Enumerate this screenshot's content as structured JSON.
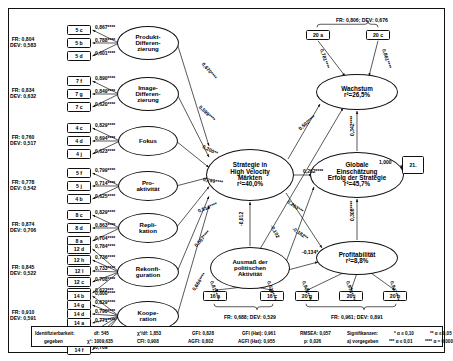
{
  "constructs": [
    {
      "id": "produkt",
      "label": "Produkt-\nDifferen-\nzierung",
      "x": 148,
      "y": 43,
      "rx": 31,
      "ry": 17
    },
    {
      "id": "image",
      "label": "Image-\nDifferen-\nzierung",
      "x": 148,
      "y": 94,
      "rx": 31,
      "ry": 17
    },
    {
      "id": "fokus",
      "label": "Fokus",
      "x": 148,
      "y": 141,
      "rx": 30,
      "ry": 15
    },
    {
      "id": "proaktivitaet",
      "label": "Pro-\naktivität",
      "x": 148,
      "y": 186,
      "rx": 30,
      "ry": 15
    },
    {
      "id": "replikation",
      "label": "Repli-\nkation",
      "x": 148,
      "y": 228,
      "rx": 30,
      "ry": 15
    },
    {
      "id": "rekonfiguration",
      "label": "Rekonfi-\nguration",
      "x": 148,
      "y": 272,
      "rx": 31,
      "ry": 15
    },
    {
      "id": "kooperation",
      "label": "Koope-\nration",
      "x": 148,
      "y": 316,
      "rx": 31,
      "ry": 15
    },
    {
      "id": "strategie",
      "label": "Strategie in\nHigh Velocity\nMärkten\nr²=40,0%",
      "x": 250,
      "y": 175,
      "rx": 44,
      "ry": 26
    },
    {
      "id": "politisch",
      "label": "Ausmaß der\npolitischen\nAktivität",
      "x": 250,
      "y": 268,
      "rx": 40,
      "ry": 21
    },
    {
      "id": "wachstum",
      "label": "Wachstum\nr²=26,5%",
      "x": 357,
      "y": 92,
      "rx": 41,
      "ry": 18
    },
    {
      "id": "global",
      "label": "Globale\nEinschätzung\nErfolg der Strategie\nr²=45,7%",
      "x": 357,
      "y": 175,
      "rx": 47,
      "ry": 23
    },
    {
      "id": "profitabilitaet",
      "label": "Profitabilität\nr²=8,8%",
      "x": 357,
      "y": 258,
      "rx": 41,
      "ry": 17
    }
  ],
  "indicator_groups": [
    {
      "id": "g-produkt",
      "fr": "FR: 0,804",
      "dev": "DEV: 0,583",
      "fr_x": 10,
      "fr_y": 40,
      "boxes": [
        {
          "label": "5 c",
          "x": 79,
          "y": 30
        },
        {
          "label": "5 b",
          "x": 79,
          "y": 43
        },
        {
          "label": "5 d",
          "x": 79,
          "y": 56
        }
      ],
      "loadings": [
        "0,867****",
        "0,788****",
        "0,601****"
      ]
    },
    {
      "id": "g-image",
      "fr": "FR: 0,834",
      "dev": "DEV: 0,632",
      "fr_x": 10,
      "fr_y": 91,
      "boxes": [
        {
          "label": "7 f",
          "x": 79,
          "y": 81
        },
        {
          "label": "7 g",
          "x": 79,
          "y": 94
        },
        {
          "label": "7 c",
          "x": 79,
          "y": 107
        }
      ],
      "loadings": [
        "0,890****",
        "0,849****",
        "0,620****"
      ]
    },
    {
      "id": "g-fokus",
      "fr": "FR: 0,760",
      "dev": "DEV: 0,517",
      "fr_x": 10,
      "fr_y": 138,
      "boxes": [
        {
          "label": "4 c",
          "x": 79,
          "y": 128
        },
        {
          "label": "4 d",
          "x": 79,
          "y": 141
        },
        {
          "label": "4 j",
          "x": 79,
          "y": 154
        }
      ],
      "loadings": [
        "0,829****",
        "0,694****",
        "0,623****"
      ]
    },
    {
      "id": "g-proaktiv",
      "fr": "FR: 0,778",
      "dev": "DEV: 0,542",
      "fr_x": 10,
      "fr_y": 183,
      "boxes": [
        {
          "label": "5 f",
          "x": 79,
          "y": 173
        },
        {
          "label": "5 j",
          "x": 79,
          "y": 186
        },
        {
          "label": "4 b",
          "x": 79,
          "y": 199
        }
      ],
      "loadings": [
        "0,799****",
        "0,714****",
        "0,625****"
      ]
    },
    {
      "id": "g-replikation",
      "fr": "FR: 0,874",
      "dev": "DEV: 0,706",
      "fr_x": 10,
      "fr_y": 225,
      "boxes": [
        {
          "label": "8 c",
          "x": 79,
          "y": 215
        },
        {
          "label": "8 d",
          "x": 79,
          "y": 228
        },
        {
          "label": "8 a",
          "x": 79,
          "y": 241
        }
      ],
      "loadings": [
        "0,829****",
        "0,863****",
        "0,704****"
      ]
    },
    {
      "id": "g-rekonfig",
      "fr": "FR: 0,845",
      "dev": "DEV: 0,522",
      "fr_x": 10,
      "fr_y": 268,
      "boxes": [
        {
          "label": "12 d",
          "x": 79,
          "y": 249
        },
        {
          "label": "12 h",
          "x": 79,
          "y": 260
        },
        {
          "label": "12 l",
          "x": 79,
          "y": 271
        },
        {
          "label": "12 c",
          "x": 79,
          "y": 282
        },
        {
          "label": "12 e",
          "x": 79,
          "y": 293
        }
      ],
      "loadings": [
        "0,784****",
        "0,736****",
        "0,733****",
        "0,708****",
        "0,622***"
      ]
    },
    {
      "id": "g-kooperation",
      "fr": "FR: 0,910",
      "dev": "DEV: 0,591",
      "fr_x": 10,
      "fr_y": 313,
      "boxes": [
        {
          "label": "14 b",
          "x": 79,
          "y": 296
        },
        {
          "label": "14 g",
          "x": 79,
          "y": 305
        },
        {
          "label": "14 d",
          "x": 79,
          "y": 314
        },
        {
          "label": "14 a",
          "x": 79,
          "y": 323
        },
        {
          "label": "14 e",
          "x": 79,
          "y": 332
        },
        {
          "label": "14 c",
          "x": 79,
          "y": 341
        },
        {
          "label": "14 f",
          "x": 79,
          "y": 350
        }
      ],
      "loadings": [
        "0,800****",
        "0,829****",
        "0,790****",
        "0,771****",
        "0,757****",
        "0,704****",
        "0,709****"
      ]
    }
  ],
  "top_group": {
    "id": "g-wachstum",
    "frdev": "FR: 0,806; DEV: 0,676",
    "x": 368,
    "y": 17,
    "boxes": [
      {
        "label": "20 a",
        "x": 318,
        "y": 35
      },
      {
        "label": "20 c",
        "x": 378,
        "y": 35
      }
    ],
    "loadings": [
      "0,781****",
      "0,861****"
    ]
  },
  "bottom_mid_group": {
    "id": "g-politisch",
    "frdev": "FR: 0,688; DEV: 0,529",
    "x": 257,
    "y": 316,
    "boxes": [
      {
        "label": "16 a",
        "x": 215,
        "y": 296
      },
      {
        "label": "16 c",
        "x": 272,
        "y": 296
      }
    ],
    "loadings": [
      "0,811****",
      "0,639****"
    ]
  },
  "bottom_right_group": {
    "id": "g-profitabilitaet",
    "frdev": "FR: 0,961; DEV: 0,891",
    "x": 364,
    "y": 316,
    "boxes": [
      {
        "label": "20 g",
        "x": 307,
        "y": 296
      },
      {
        "label": "20 i",
        "x": 351,
        "y": 296
      },
      {
        "label": "20 h",
        "x": 395,
        "y": 296
      }
    ],
    "loadings": [
      "0,908****",
      "0,978****",
      "0,947****"
    ]
  },
  "terminal_box": {
    "label": "21.",
    "x": 413,
    "y": 165,
    "path_label": "1,000"
  },
  "structural_paths": [
    {
      "id": "produkt-strategie",
      "label": "0,670****",
      "x": 203,
      "y": 60,
      "rot": 50
    },
    {
      "id": "image-strategie",
      "label": "0,599****",
      "x": 200,
      "y": 103,
      "rot": 44
    },
    {
      "id": "fokus-strategie",
      "label": "0,200**",
      "x": 203,
      "y": 143,
      "rot": 27
    },
    {
      "id": "proaktiv-strategie",
      "label": "0,799****",
      "x": 203,
      "y": 176,
      "rot": 9
    },
    {
      "id": "replikation-strategie",
      "label": "0,514****",
      "x": 198,
      "y": 208,
      "rot": -22
    },
    {
      "id": "rekonfig-strategie",
      "label": "0,587****",
      "x": 195,
      "y": 243,
      "rot": -48
    },
    {
      "id": "kooperation-strategie",
      "label": "0,664****",
      "x": 193,
      "y": 287,
      "rot": -56
    },
    {
      "id": "strategie-wachstum",
      "label": "0,502****",
      "x": 299,
      "y": 126,
      "rot": -40
    },
    {
      "id": "strategie-global",
      "label": "0,262****",
      "x": 303,
      "y": 168,
      "rot": 0
    },
    {
      "id": "strategie-profitabilitaet",
      "label": "0,263***",
      "x": 288,
      "y": 198,
      "rot": 35
    },
    {
      "id": "politisch-wachstum",
      "label": "-0,102",
      "x": 272,
      "y": 222,
      "rot": 63
    },
    {
      "id": "politisch-global",
      "label": "-0,182**",
      "x": 293,
      "y": 225,
      "rot": 35
    },
    {
      "id": "politisch-profitabilitaet",
      "label": "-0,134*",
      "x": 302,
      "y": 249,
      "rot": 0
    },
    {
      "id": "politisch-strategie",
      "label": "-0,012",
      "x": 241,
      "y": 223,
      "rot": -90
    },
    {
      "id": "global-wachstum",
      "label": "0,342****",
      "x": 352,
      "y": 133,
      "rot": -90
    },
    {
      "id": "profitabilitaet-global",
      "label": "0,308****",
      "x": 352,
      "y": 218,
      "rot": -90
    }
  ],
  "footer": {
    "col1_line1": "Identifizierbarkeit:",
    "col1_line2": "gegeben",
    "col2_line1": "df: 545",
    "col2_line2": "χ²: 1009,635",
    "col3_line1": "χ²/df: 1,853",
    "col3_line2": "CFI: 0,908",
    "col4_line1": "GFI: 0,828",
    "col4_line2": "AGFI: 0,802",
    "col5_line1": "GFI (Hat): 0,961",
    "col5_line2": "AGFI (Hat): 0,955",
    "col6_line1": "RMSEA: 0,057",
    "col6_line2": "p: 0,026",
    "col7_line1": "Signifikanzen:",
    "col7_line2": "a) vorgegeben",
    "col8_line1": "*  α ≤ 0,10",
    "col8_line2": "***  α ≤ 0,01",
    "col9_line1": "**  α ≤ 0,05",
    "col9_line2": "****  α = 0,000"
  }
}
